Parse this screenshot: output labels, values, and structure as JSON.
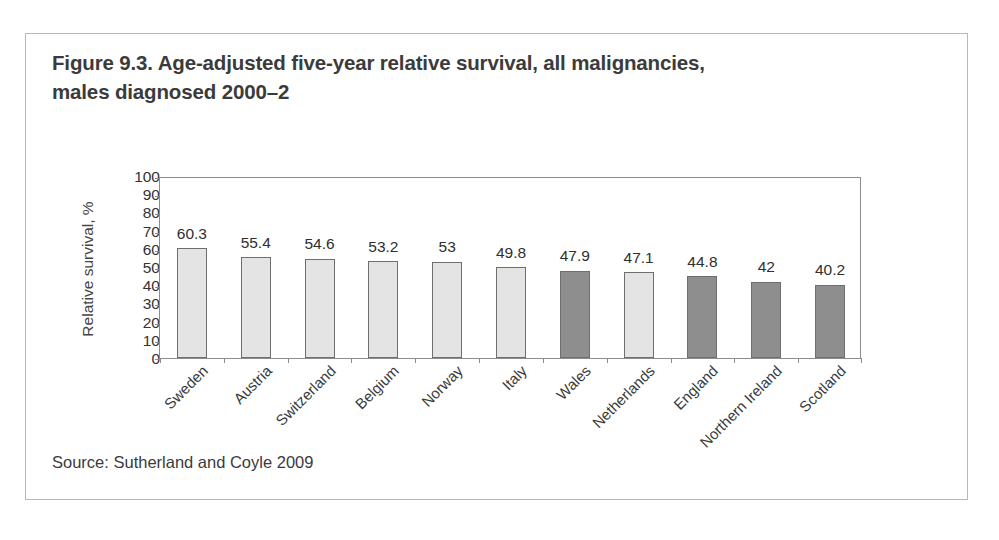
{
  "figure": {
    "title": "Figure 9.3. Age-adjusted five-year relative survival, all malignancies, males diagnosed 2000–2",
    "source": "Source: Sutherland and Coyle 2009"
  },
  "colors": {
    "bar_light_fill": "#e4e4e4",
    "bar_dark_fill": "#8e8e8e",
    "bar_outline": "#6e6e6e",
    "axis_line": "#8d8d8d",
    "frame_border": "#b9b9b9",
    "title_text": "#3b3b3b",
    "body_text": "#333333"
  },
  "chart_data": {
    "type": "bar",
    "title": "Figure 9.3. Age-adjusted five-year relative survival, all malignancies, males diagnosed 2000–2",
    "xlabel": "",
    "ylabel": "Relative survival, %",
    "ylim": [
      0,
      100
    ],
    "ytick_step": 10,
    "yticks": [
      100,
      90,
      80,
      70,
      60,
      50,
      40,
      30,
      20,
      10,
      0
    ],
    "grid": false,
    "legend": false,
    "value_labels": true,
    "categories": [
      "Sweden",
      "Austria",
      "Switzerland",
      "Belgium",
      "Norway",
      "Italy",
      "Wales",
      "Netherlands",
      "England",
      "Northern Ireland",
      "Scotland"
    ],
    "values": [
      60.3,
      55.4,
      54.6,
      53.2,
      53,
      49.8,
      47.9,
      47.1,
      44.8,
      42,
      40.2
    ],
    "value_labels_text": [
      "60.3",
      "55.4",
      "54.6",
      "53.2",
      "53",
      "49.8",
      "47.9",
      "47.1",
      "44.8",
      "42",
      "40.2"
    ],
    "bar_shades": [
      "light",
      "light",
      "light",
      "light",
      "light",
      "light",
      "dark",
      "light",
      "dark",
      "dark",
      "dark"
    ],
    "highlight_note": "dark bars are UK nations"
  }
}
